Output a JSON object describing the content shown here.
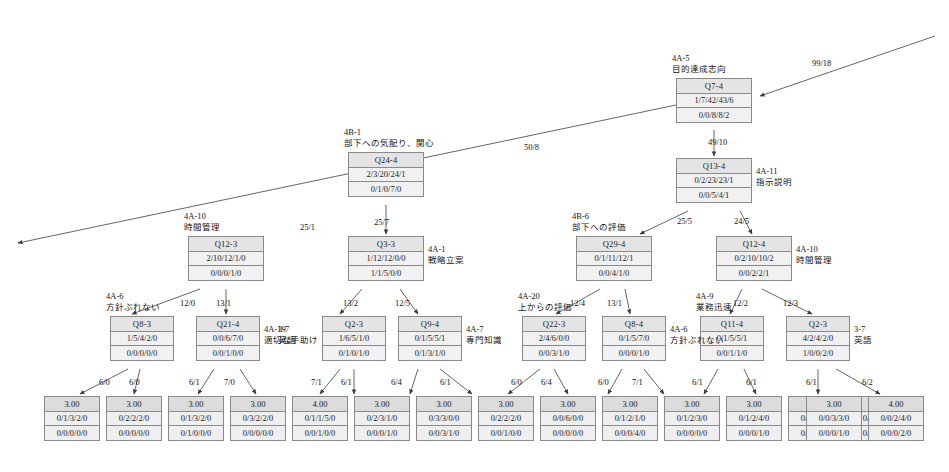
{
  "diagram": {
    "type": "decision-tree",
    "title": "",
    "node_row_labels": [
      "question_id",
      "class_distribution_a",
      "class_distribution_b"
    ],
    "nodes": [
      {
        "id": "n_q7_4",
        "question": "Q7-4",
        "row2": "1/7/42/43/6",
        "row3": "0/0/8/8/2",
        "tag_code": "4A-5",
        "tag_text": "目的達成志向",
        "tag_pos": "above",
        "x": 676,
        "y": 78,
        "w": 76
      },
      {
        "id": "n_q13_4",
        "question": "Q13-4",
        "row2": "0/2/23/23/1",
        "row3": "0/0/5/4/1",
        "tag_code": "4A-11",
        "tag_text": "指示説明",
        "tag_pos": "right",
        "x": 676,
        "y": 158,
        "w": 76
      },
      {
        "id": "n_q24_4",
        "question": "Q24-4",
        "row2": "2/3/20/24/1",
        "row3": "0/1/0/7/0",
        "tag_code": "4B-1",
        "tag_text": "部下への気配り、関心",
        "tag_pos": "above",
        "x": 348,
        "y": 152,
        "w": 76
      },
      {
        "id": "n_q12_3",
        "question": "Q12-3",
        "row2": "2/10/12/1/0",
        "row3": "0/0/0/1/0",
        "tag_code": "4A-10",
        "tag_text": "時間管理",
        "tag_pos": "above",
        "x": 188,
        "y": 236,
        "w": 76
      },
      {
        "id": "n_q3_3",
        "question": "Q3-3",
        "row2": "1/12/12/0/0",
        "row3": "1/1/5/0/0",
        "tag_code": "4A-1",
        "tag_text": "戦略立案",
        "tag_pos": "right",
        "x": 348,
        "y": 236,
        "w": 76
      },
      {
        "id": "n_q29_4",
        "question": "Q29-4",
        "row2": "0/1/11/12/1",
        "row3": "0/0/4/1/0",
        "tag_code": "4B-6",
        "tag_text": "部下への評価",
        "tag_pos": "above",
        "x": 576,
        "y": 236,
        "w": 76
      },
      {
        "id": "n_q12_4",
        "question": "Q12-4",
        "row2": "0/2/10/10/2",
        "row3": "0/0/2/2/1",
        "tag_code": "4A-10",
        "tag_text": "時間管理",
        "tag_pos": "right",
        "x": 716,
        "y": 236,
        "w": 76
      },
      {
        "id": "n_q8_3",
        "question": "Q8-3",
        "row2": "1/5/4/2/0",
        "row3": "0/0/0/0/0",
        "tag_code": "4A-6",
        "tag_text": "方針ぶれない",
        "tag_pos": "above",
        "x": 110,
        "y": 316,
        "w": 64
      },
      {
        "id": "n_q21_4",
        "question": "Q21-4",
        "row2": "0/0/6/7/0",
        "row3": "0/0/1/0/0",
        "tag_code": "4A-19",
        "tag_text": "適切な手助け",
        "tag_pos": "right",
        "x": 196,
        "y": 316,
        "w": 64
      },
      {
        "id": "n_q2_3a",
        "question": "Q2-3",
        "row2": "1/6/5/1/0",
        "row3": "0/1/0/1/0",
        "tag_code": "3-7",
        "tag_text": "英語",
        "tag_pos": "left",
        "x": 322,
        "y": 316,
        "w": 64
      },
      {
        "id": "n_q9_4",
        "question": "Q9-4",
        "row2": "0/1/5/5/1",
        "row3": "0/1/3/1/0",
        "tag_code": "4A-7",
        "tag_text": "専門知識",
        "tag_pos": "right",
        "x": 398,
        "y": 316,
        "w": 64
      },
      {
        "id": "n_q22_3",
        "question": "Q22-3",
        "row2": "2/4/6/0/0",
        "row3": "0/0/3/1/0",
        "tag_code": "4A-20",
        "tag_text": "上からの評価",
        "tag_pos": "above",
        "x": 522,
        "y": 316,
        "w": 64
      },
      {
        "id": "n_q8_4",
        "question": "Q8-4",
        "row2": "0/1/5/7/0",
        "row3": "0/0/0/1/0",
        "tag_code": "4A-6",
        "tag_text": "方針ぶれない",
        "tag_pos": "right",
        "x": 602,
        "y": 316,
        "w": 64
      },
      {
        "id": "n_q11_4",
        "question": "Q11-4",
        "row2": "0/1/5/5/1",
        "row3": "0/0/1/1/0",
        "tag_code": "4A-9",
        "tag_text": "業務迅速",
        "tag_pos": "above",
        "x": 700,
        "y": 316,
        "w": 64
      },
      {
        "id": "n_q2_3b",
        "question": "Q2-3",
        "row2": "4/2/4/2/0",
        "row3": "1/0/0/2/0",
        "tag_code": "3-7",
        "tag_text": "英語",
        "tag_pos": "right",
        "x": 786,
        "y": 316,
        "w": 64
      }
    ],
    "leaves": [
      {
        "id": "l1",
        "value": "3.00",
        "row2": "0/1/3/2/0",
        "row3": "0/0/0/0/0",
        "x": 44,
        "y": 396,
        "w": 56
      },
      {
        "id": "l2",
        "value": "3.00",
        "row2": "0/2/2/2/0",
        "row3": "0/0/0/0/0",
        "x": 106,
        "y": 396,
        "w": 56
      },
      {
        "id": "l3",
        "value": "3.00",
        "row2": "0/1/3/2/0",
        "row3": "0/1/0/0/0",
        "x": 168,
        "y": 396,
        "w": 56
      },
      {
        "id": "l4",
        "value": "3.00",
        "row2": "0/3/2/2/0",
        "row3": "0/0/0/0/0",
        "x": 230,
        "y": 396,
        "w": 56
      },
      {
        "id": "l5",
        "value": "4.00",
        "row2": "0/1/1/5/0",
        "row3": "0/0/1/0/0",
        "x": 292,
        "y": 396,
        "w": 56
      },
      {
        "id": "l6",
        "value": "3.00",
        "row2": "0/2/3/1/0",
        "row3": "0/0/0/1/0",
        "x": 354,
        "y": 396,
        "w": 56
      },
      {
        "id": "l7",
        "value": "3.00",
        "row2": "0/3/3/0/0",
        "row3": "0/0/3/1/0",
        "x": 416,
        "y": 396,
        "w": 56
      },
      {
        "id": "l8",
        "value": "3.00",
        "row2": "0/2/2/2/0",
        "row3": "0/0/1/0/0",
        "x": 478,
        "y": 396,
        "w": 56
      },
      {
        "id": "l9",
        "value": "3.00",
        "row2": "0/0/6/0/0",
        "row3": "0/0/0/0/0",
        "x": 540,
        "y": 396,
        "w": 56
      },
      {
        "id": "l10",
        "value": "3.00",
        "row2": "0/1/2/1/0",
        "row3": "0/0/0/4/0",
        "x": 602,
        "y": 396,
        "w": 56
      },
      {
        "id": "l11",
        "value": "3.00",
        "row2": "0/1/2/3/0",
        "row3": "0/0/0/0/0",
        "x": 664,
        "y": 396,
        "w": 56
      },
      {
        "id": "l12",
        "value": "3.00",
        "row2": "0/1/2/4/0",
        "row3": "0/0/0/1/0",
        "x": 726,
        "y": 396,
        "w": 56
      },
      {
        "id": "l13",
        "value": "3.00",
        "row2": "0/2/2/2/0",
        "row3": "0/0/1/0/0",
        "x": 788,
        "y": 396,
        "w": 56
      },
      {
        "id": "l14",
        "value": "3.00",
        "row2": "0/2/3/1/0",
        "row3": "0/0/0/1/0",
        "x": 850,
        "y": 396,
        "w": 56
      },
      {
        "id": "l15",
        "value": "3.00",
        "row2": "0/0/3/3/0",
        "row3": "0/0/0/1/0",
        "x": 806,
        "y": 396,
        "w": 56
      },
      {
        "id": "l16",
        "value": "4.00",
        "row2": "0/0/2/4/0",
        "row3": "0/0/0/2/0",
        "x": 868,
        "y": 396,
        "w": 56
      }
    ],
    "edge_labels": [
      {
        "id": "e_root_in",
        "text": "99/18",
        "x": 812,
        "y": 58
      },
      {
        "id": "e_q7_q24",
        "text": "50/8",
        "x": 524,
        "y": 142
      },
      {
        "id": "e_q7_q13",
        "text": "49/10",
        "x": 708,
        "y": 137
      },
      {
        "id": "e_q24_q12_3",
        "text": "25/1",
        "x": 300,
        "y": 222
      },
      {
        "id": "e_q24_q3",
        "text": "25/7",
        "x": 374,
        "y": 217
      },
      {
        "id": "e_q13_q29",
        "text": "25/5",
        "x": 677,
        "y": 216
      },
      {
        "id": "e_q13_q12_4",
        "text": "24/5",
        "x": 734,
        "y": 216
      },
      {
        "id": "e_q12_q8",
        "text": "12/0",
        "x": 180,
        "y": 298
      },
      {
        "id": "e_q12_q21",
        "text": "13/1",
        "x": 216,
        "y": 298
      },
      {
        "id": "e_q3_q2",
        "text": "13/2",
        "x": 343,
        "y": 298
      },
      {
        "id": "e_q3_q9",
        "text": "12/5",
        "x": 395,
        "y": 298
      },
      {
        "id": "e_q29_q22",
        "text": "12/4",
        "x": 570,
        "y": 298
      },
      {
        "id": "e_q29_q8_4",
        "text": "13/1",
        "x": 607,
        "y": 298
      },
      {
        "id": "e_q12_q11",
        "text": "12/2",
        "x": 733,
        "y": 298
      },
      {
        "id": "e_q12_q2b",
        "text": "12/3",
        "x": 783,
        "y": 298
      },
      {
        "id": "e_q8_l1",
        "text": "6/0",
        "x": 99,
        "y": 377
      },
      {
        "id": "e_q8_l2",
        "text": "6/0",
        "x": 129,
        "y": 377
      },
      {
        "id": "e_q21_l3",
        "text": "6/1",
        "x": 189,
        "y": 377
      },
      {
        "id": "e_q21_l4",
        "text": "7/0",
        "x": 224,
        "y": 377
      },
      {
        "id": "e_q2a_l5",
        "text": "7/1",
        "x": 311,
        "y": 377
      },
      {
        "id": "e_q2a_l6",
        "text": "6/1",
        "x": 341,
        "y": 377
      },
      {
        "id": "e_q9_l7",
        "text": "6/4",
        "x": 391,
        "y": 377
      },
      {
        "id": "e_q9_l8",
        "text": "6/1",
        "x": 440,
        "y": 377
      },
      {
        "id": "e_q22_l9",
        "text": "6/0",
        "x": 511,
        "y": 377
      },
      {
        "id": "e_q22_l10",
        "text": "6/4",
        "x": 541,
        "y": 377
      },
      {
        "id": "e_q8_4_l11",
        "text": "6/0",
        "x": 598,
        "y": 377
      },
      {
        "id": "e_q8_4_l12",
        "text": "7/1",
        "x": 632,
        "y": 377
      },
      {
        "id": "e_q11_l13",
        "text": "6/1",
        "x": 692,
        "y": 377
      },
      {
        "id": "e_q11_l14",
        "text": "6/1",
        "x": 746,
        "y": 377
      },
      {
        "id": "e_q2b_l15",
        "text": "6/1",
        "x": 806,
        "y": 377
      },
      {
        "id": "e_q2b_l16",
        "text": "6/2",
        "x": 862,
        "y": 377
      }
    ]
  }
}
